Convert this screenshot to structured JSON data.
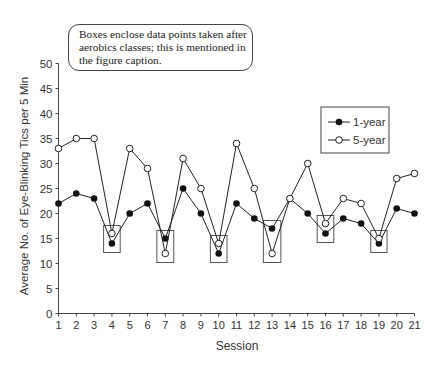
{
  "annotation": {
    "lines": [
      "Boxes enclose data points taken after",
      "aerobics classes; this is mentioned in",
      "the figure caption."
    ]
  },
  "chart_data": {
    "type": "line",
    "title": "",
    "xlabel": "Session",
    "ylabel": "Average No. of Eye-Blinking Tics per 5 Min",
    "x": [
      1,
      2,
      3,
      4,
      5,
      6,
      7,
      8,
      9,
      10,
      11,
      12,
      13,
      14,
      15,
      16,
      17,
      18,
      19,
      20,
      21
    ],
    "xticks": [
      "1",
      "2",
      "3",
      "4",
      "5",
      "6",
      "7",
      "8",
      "9",
      "10",
      "11",
      "12",
      "13",
      "14",
      "15",
      "16",
      "17",
      "18",
      "19",
      "20",
      "21"
    ],
    "yticks": [
      "0",
      "5",
      "10",
      "15",
      "20",
      "25",
      "30",
      "35",
      "40",
      "45",
      "50"
    ],
    "ylim": [
      0,
      50
    ],
    "grid": false,
    "legend_position": "upper right",
    "series": [
      {
        "name": "1-year",
        "marker": "filled-circle",
        "values": [
          22,
          24,
          23,
          14,
          20,
          22,
          15,
          25,
          20,
          12,
          22,
          19,
          17,
          23,
          20,
          16,
          19,
          18,
          14,
          21,
          20
        ]
      },
      {
        "name": "5-year",
        "marker": "open-circle",
        "values": [
          33,
          35,
          35,
          16,
          33,
          29,
          12,
          31,
          25,
          14,
          34,
          25,
          12,
          23,
          30,
          18,
          23,
          22,
          15,
          27,
          28
        ]
      }
    ],
    "highlighted_sessions": [
      4,
      7,
      10,
      13,
      16,
      19
    ],
    "highlight_note": "Boxes enclose data points taken after aerobics classes"
  },
  "colors": {
    "line": "#222222",
    "box": "#555555",
    "axis": "#444444",
    "text": "#333333"
  }
}
